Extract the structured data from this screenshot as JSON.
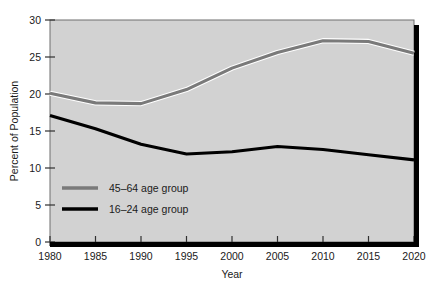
{
  "chart_data": {
    "type": "line",
    "title": "",
    "xlabel": "Year",
    "ylabel": "Percent of Population",
    "x": [
      1980,
      1985,
      1990,
      1995,
      2000,
      2005,
      2010,
      2015,
      2020
    ],
    "xtick_labels": [
      "1980",
      "1985",
      "1990",
      "1995",
      "2000",
      "2005",
      "2010",
      "2015",
      "2020"
    ],
    "ytick_labels": [
      "0",
      "5",
      "10",
      "15",
      "20",
      "25",
      "30"
    ],
    "ytick_values": [
      0,
      5,
      10,
      15,
      20,
      25,
      30
    ],
    "xlim": [
      1980,
      2020
    ],
    "ylim": [
      0,
      30
    ],
    "grid": false,
    "legend_position": "inside-lower-left",
    "plot_background": "#d2d2d2",
    "series": [
      {
        "name": "45–64 age group",
        "color": "#7a7a7a",
        "values": [
          20.1,
          18.8,
          18.7,
          20.6,
          23.5,
          25.6,
          27.2,
          27.1,
          25.5
        ]
      },
      {
        "name": "16–24 age group",
        "color": "#000000",
        "values": [
          17.1,
          15.3,
          13.2,
          11.9,
          12.2,
          12.9,
          12.5,
          11.8,
          11.1
        ]
      }
    ]
  },
  "legend": {
    "entries": [
      {
        "label": "45–64 age group",
        "color": "#7a7a7a"
      },
      {
        "label": "16–24 age group",
        "color": "#000000"
      }
    ]
  },
  "axes": {
    "y_title": "Percent of Population",
    "x_title": "Year"
  }
}
